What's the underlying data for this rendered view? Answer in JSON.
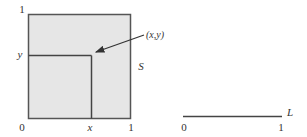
{
  "square": {
    "name": "S",
    "fill": "#e6e6e6",
    "stroke": "#555555",
    "axis_labels": {
      "origin": "0",
      "x_max": "1",
      "y_max": "1",
      "x": "x",
      "y": "y"
    },
    "point_label": "(x,y)"
  },
  "line": {
    "name": "L",
    "start_label": "0",
    "end_label": "1",
    "stroke": "#444444"
  }
}
